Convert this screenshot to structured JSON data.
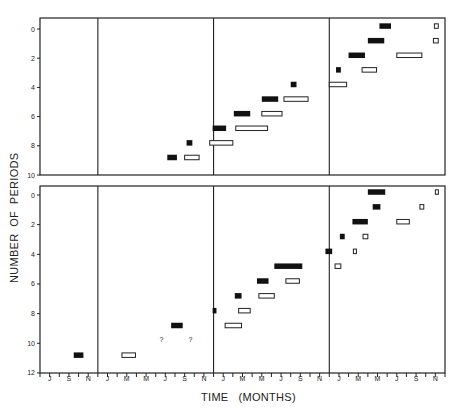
{
  "chart_data": {
    "type": "gantt-like dot/bar plot",
    "xlabel": "TIME   (MONTHS)",
    "ylabel": "NUMBER  OF  PERIODS",
    "month_ticks": [
      "J",
      "S",
      "N",
      "J",
      "M",
      "M",
      "J",
      "S",
      "N",
      "J",
      "M",
      "M",
      "J",
      "S",
      "N",
      "J",
      "M",
      "M",
      "J",
      "S",
      "N"
    ],
    "year_dividers_month_index": [
      6,
      18,
      30
    ],
    "panels": [
      {
        "name": "top",
        "ylim": [
          0,
          10
        ],
        "yticks": [
          0,
          2,
          4,
          6,
          8,
          10
        ],
        "filled_bars": [
          {
            "start": 13.2,
            "end": 14.2,
            "y": 8.8
          },
          {
            "start": 15.2,
            "end": 15.8,
            "y": 7.8
          },
          {
            "start": 17.9,
            "end": 19.3,
            "y": 6.8
          },
          {
            "start": 20.1,
            "end": 21.8,
            "y": 5.8
          },
          {
            "start": 23.0,
            "end": 24.7,
            "y": 4.8
          },
          {
            "start": 26.0,
            "end": 26.6,
            "y": 3.8
          },
          {
            "start": 30.7,
            "end": 31.2,
            "y": 2.8
          },
          {
            "start": 32.0,
            "end": 33.7,
            "y": 1.8
          },
          {
            "start": 34.0,
            "end": 35.7,
            "y": 0.8
          },
          {
            "start": 35.2,
            "end": 36.4,
            "y": -0.2
          }
        ],
        "open_bars": [
          {
            "start": 15.0,
            "end": 16.5,
            "y": 8.8
          },
          {
            "start": 17.6,
            "end": 20.0,
            "y": 7.8
          },
          {
            "start": 20.3,
            "end": 23.6,
            "y": 6.8
          },
          {
            "start": 23.0,
            "end": 25.1,
            "y": 5.8
          },
          {
            "start": 25.3,
            "end": 27.8,
            "y": 4.8
          },
          {
            "start": 30.0,
            "end": 31.8,
            "y": 3.8
          },
          {
            "start": 33.4,
            "end": 34.9,
            "y": 2.8
          },
          {
            "start": 37.0,
            "end": 39.6,
            "y": 1.8
          },
          {
            "start": 40.8,
            "end": 41.3,
            "y": 0.8
          },
          {
            "start": 40.9,
            "end": 41.3,
            "y": -0.2
          }
        ]
      },
      {
        "name": "bottom",
        "ylim": [
          0,
          12
        ],
        "yticks": [
          0,
          2,
          4,
          6,
          8,
          10,
          12
        ],
        "filled_bars": [
          {
            "start": 3.5,
            "end": 4.5,
            "y": 10.8
          },
          {
            "start": 13.6,
            "end": 14.8,
            "y": 8.8
          },
          {
            "start": 17.9,
            "end": 18.3,
            "y": 7.8
          },
          {
            "start": 20.2,
            "end": 20.9,
            "y": 6.8
          },
          {
            "start": 22.5,
            "end": 23.7,
            "y": 5.8
          },
          {
            "start": 24.3,
            "end": 27.2,
            "y": 4.8
          },
          {
            "start": 29.6,
            "end": 30.3,
            "y": 3.8
          },
          {
            "start": 31.1,
            "end": 31.6,
            "y": 2.8
          },
          {
            "start": 32.4,
            "end": 34.0,
            "y": 1.8
          },
          {
            "start": 34.5,
            "end": 35.3,
            "y": 0.8
          },
          {
            "start": 34.0,
            "end": 35.8,
            "y": -0.2
          }
        ],
        "open_bars": [
          {
            "start": 8.5,
            "end": 9.9,
            "y": 10.8
          },
          {
            "start": 19.2,
            "end": 20.9,
            "y": 8.8
          },
          {
            "start": 20.6,
            "end": 21.8,
            "y": 7.8
          },
          {
            "start": 22.7,
            "end": 24.3,
            "y": 6.8
          },
          {
            "start": 25.5,
            "end": 26.9,
            "y": 5.8
          },
          {
            "start": 30.6,
            "end": 31.2,
            "y": 4.8
          },
          {
            "start": 32.5,
            "end": 32.8,
            "y": 3.8
          },
          {
            "start": 33.5,
            "end": 34.0,
            "y": 2.8
          },
          {
            "start": 37.0,
            "end": 38.3,
            "y": 1.8
          },
          {
            "start": 39.4,
            "end": 39.8,
            "y": 0.8
          },
          {
            "start": 41.0,
            "end": 41.3,
            "y": -0.2
          }
        ],
        "annotations": [
          {
            "text": "?",
            "month": 12.6,
            "y": 9.8
          },
          {
            "text": "?",
            "month": 15.6,
            "y": 9.8
          }
        ]
      }
    ]
  }
}
